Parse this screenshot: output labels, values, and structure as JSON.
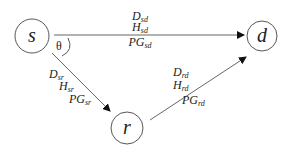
{
  "diagram": {
    "type": "relay-network",
    "nodes": [
      {
        "id": "s",
        "label": "s",
        "cx": 32,
        "cy": 36,
        "r": 17
      },
      {
        "id": "d",
        "label": "d",
        "cx": 262,
        "cy": 36,
        "r": 15
      },
      {
        "id": "r",
        "label": "r",
        "cx": 127,
        "cy": 128,
        "r": 16
      }
    ],
    "angle_label": "θ",
    "edges": {
      "sd": {
        "from": "s",
        "to": "d",
        "labels": [
          {
            "base": "D",
            "sub": "sd"
          },
          {
            "base": "H",
            "sub": "sd"
          },
          {
            "base": "PG",
            "sub": "sd"
          }
        ]
      },
      "sr": {
        "from": "s",
        "to": "r",
        "labels": [
          {
            "base": "D",
            "sub": "sr"
          },
          {
            "base": "H",
            "sub": "sr"
          },
          {
            "base": "PG",
            "sub": "sr"
          }
        ]
      },
      "rd": {
        "from": "r",
        "to": "d",
        "labels": [
          {
            "base": "D",
            "sub": "rd"
          },
          {
            "base": "H",
            "sub": "rd"
          },
          {
            "base": "PG",
            "sub": "rd"
          }
        ]
      }
    }
  }
}
